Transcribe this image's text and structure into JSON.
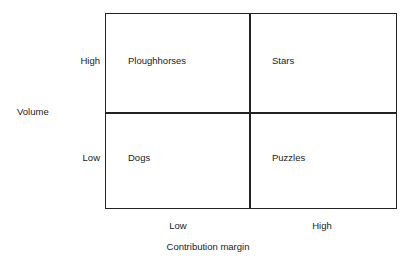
{
  "chart_data": {
    "type": "table",
    "title": "",
    "xlabel": "Contribution margin",
    "ylabel": "Volume",
    "x_tick_labels": [
      "Low",
      "High"
    ],
    "y_tick_labels": [
      "High",
      "Low"
    ],
    "grid": true,
    "legend": "none",
    "cells": [
      {
        "x": "Low",
        "y": "High",
        "label": "Ploughhorses"
      },
      {
        "x": "High",
        "y": "High",
        "label": "Stars"
      },
      {
        "x": "Low",
        "y": "Low",
        "label": "Dogs"
      },
      {
        "x": "High",
        "y": "Low",
        "label": "Puzzles"
      }
    ],
    "colors": {
      "line": "#222222",
      "text": "#1a1a1a",
      "background": "#ffffff"
    }
  },
  "figure": {
    "axes": {
      "y": {
        "title": "Volume",
        "ticks": {
          "high": "High",
          "low": "Low"
        }
      },
      "x": {
        "title": "Contribution margin",
        "ticks": {
          "low": "Low",
          "high": "High"
        }
      }
    },
    "quadrants": {
      "top_left": "Ploughhorses",
      "top_right": "Stars",
      "bottom_left": "Dogs",
      "bottom_right": "Puzzles"
    }
  }
}
